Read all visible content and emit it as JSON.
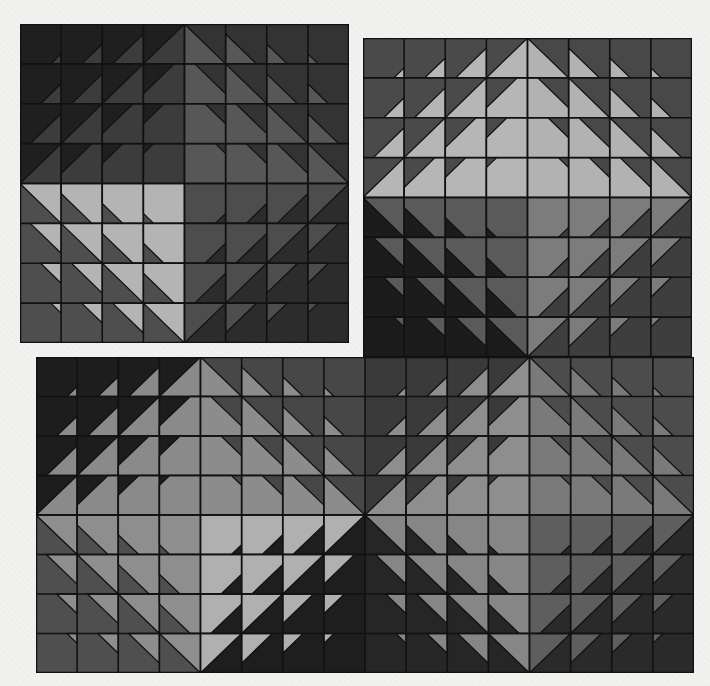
{
  "artwork": {
    "background_color": "#f1f1ef",
    "line_color": "#111111",
    "panels": [
      {
        "name": "panel-top-left",
        "x": 20,
        "y": 24,
        "width": 329,
        "height": 319,
        "cols": 8,
        "rows": 8,
        "quadrants": [
          {
            "col0": 0,
            "row0": 0,
            "cols": 4,
            "rows": 4,
            "bg": "#1f1f1f",
            "fg": "#3c3c3c",
            "anchor": "br",
            "grow": "br"
          },
          {
            "col0": 4,
            "row0": 0,
            "cols": 4,
            "rows": 4,
            "bg": "#333333",
            "fg": "#575757",
            "anchor": "bl",
            "grow": "bl"
          },
          {
            "col0": 0,
            "row0": 4,
            "cols": 4,
            "rows": 4,
            "bg": "#4e4e4e",
            "fg": "#b4b4b4",
            "anchor": "tr",
            "grow": "tr"
          },
          {
            "col0": 4,
            "row0": 4,
            "cols": 4,
            "rows": 4,
            "bg": "#2c2c2c",
            "fg": "#4d4d4d",
            "anchor": "tl",
            "grow": "tl"
          }
        ]
      },
      {
        "name": "panel-top-right",
        "x": 363,
        "y": 38,
        "width": 329,
        "height": 319,
        "cols": 8,
        "rows": 8,
        "quadrants": [
          {
            "col0": 0,
            "row0": 0,
            "cols": 4,
            "rows": 4,
            "bg": "#4a4a4a",
            "fg": "#b6b6b6",
            "anchor": "br",
            "grow": "br"
          },
          {
            "col0": 4,
            "row0": 0,
            "cols": 4,
            "rows": 4,
            "bg": "#484848",
            "fg": "#b2b2b2",
            "anchor": "bl",
            "grow": "bl"
          },
          {
            "col0": 0,
            "row0": 4,
            "cols": 4,
            "rows": 4,
            "bg": "#1c1c1c",
            "fg": "#5a5a5a",
            "anchor": "tr",
            "grow": "tr"
          },
          {
            "col0": 4,
            "row0": 4,
            "cols": 4,
            "rows": 4,
            "bg": "#3e3e3e",
            "fg": "#7c7c7c",
            "anchor": "tl",
            "grow": "tl"
          }
        ]
      },
      {
        "name": "panel-bottom",
        "x": 36,
        "y": 357,
        "width": 658,
        "height": 316,
        "cols": 16,
        "rows": 8,
        "quadrants": [
          {
            "col0": 0,
            "row0": 0,
            "cols": 4,
            "rows": 4,
            "bg": "#1d1d1d",
            "fg": "#8a8a8a",
            "anchor": "br",
            "grow": "br"
          },
          {
            "col0": 4,
            "row0": 0,
            "cols": 4,
            "rows": 4,
            "bg": "#474747",
            "fg": "#8c8c8c",
            "anchor": "bl",
            "grow": "bl"
          },
          {
            "col0": 0,
            "row0": 4,
            "cols": 4,
            "rows": 4,
            "bg": "#4f4f4f",
            "fg": "#8e8e8e",
            "anchor": "tr",
            "grow": "tr"
          },
          {
            "col0": 4,
            "row0": 4,
            "cols": 4,
            "rows": 4,
            "bg": "#1e1e1e",
            "fg": "#b0b0b0",
            "anchor": "tl",
            "grow": "tl"
          },
          {
            "col0": 8,
            "row0": 0,
            "cols": 4,
            "rows": 4,
            "bg": "#3a3a3a",
            "fg": "#8e8e8e",
            "anchor": "br",
            "grow": "br"
          },
          {
            "col0": 12,
            "row0": 0,
            "cols": 4,
            "rows": 4,
            "bg": "#4c4c4c",
            "fg": "#7a7a7a",
            "anchor": "bl",
            "grow": "bl"
          },
          {
            "col0": 8,
            "row0": 4,
            "cols": 4,
            "rows": 4,
            "bg": "#262626",
            "fg": "#868686",
            "anchor": "tr",
            "grow": "tr"
          },
          {
            "col0": 12,
            "row0": 4,
            "cols": 4,
            "rows": 4,
            "bg": "#2a2a2a",
            "fg": "#5e5e5e",
            "anchor": "tl",
            "grow": "tl"
          }
        ]
      }
    ]
  }
}
